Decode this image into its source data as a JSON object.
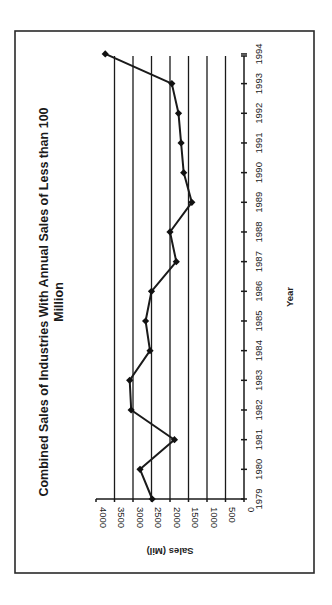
{
  "chart_data": {
    "type": "line",
    "title": "Combined Sales of Industries With Annual Sales of Less than 100 Million",
    "title_lines": [
      "Combined Sales of Industries With Annual Sales of Less than 100",
      "Million"
    ],
    "xlabel": "Year",
    "ylabel": "Sales (Mil)",
    "orientation": "rotated 90° counter-clockwise on page",
    "x": [
      1979,
      1980,
      1981,
      1982,
      1983,
      1984,
      1985,
      1986,
      1987,
      1988,
      1989,
      1990,
      1991,
      1992,
      1993,
      1994
    ],
    "series": [
      {
        "name": "Combined Sales",
        "values": [
          2480,
          2810,
          1880,
          3050,
          3090,
          2540,
          2660,
          2500,
          1830,
          2000,
          1410,
          1630,
          1700,
          1770,
          1950,
          3750
        ],
        "marker": "diamond"
      }
    ],
    "ylim": [
      0,
      4000
    ],
    "yticks": [
      0,
      500,
      1000,
      1500,
      2000,
      2500,
      3000,
      3500,
      4000
    ],
    "xticks": [
      "1979",
      "1980",
      "1981",
      "1982",
      "1983",
      "1984",
      "1985",
      "1986",
      "1987",
      "1988",
      "1989",
      "1990",
      "1991",
      "1992",
      "1993",
      "1994"
    ],
    "grid": "horizontal major gridlines",
    "legend": "none"
  },
  "colors": {
    "line": "#1a1a1a",
    "grid": "#1a1a1a",
    "frame": "#2a2a2a",
    "background": "#ffffff"
  }
}
